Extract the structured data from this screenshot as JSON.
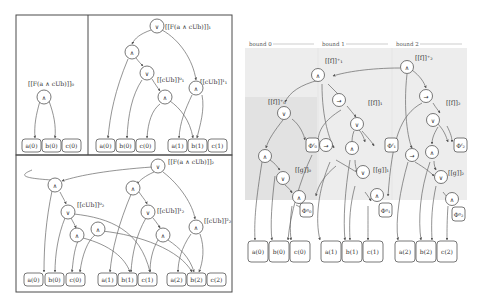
{
  "left_figure": {
    "panels": [
      {
        "id": "bound0",
        "label": "[[F(a ∧ cUb)]]₀",
        "root_symbol": "∧",
        "leaves": [
          "a(0)",
          "b(0)",
          "c(0)"
        ]
      },
      {
        "id": "bound1",
        "label": "[[F(a ∧ cUb)]]₁",
        "root_symbol": "∨",
        "sub_labels": [
          "[[cUb]]⁰₁",
          "[[cUb]]¹₁"
        ],
        "leaves": [
          "a(0)",
          "b(0)",
          "c(0)",
          "a(1)",
          "b(1)",
          "c(1)"
        ]
      },
      {
        "id": "bound2",
        "label": "[[F(a ∧ cUb)]]₂",
        "root_symbol": "∨",
        "sub_labels": [
          "[[cUb]]⁰₂",
          "[[cUb]]¹₂",
          "[[cUb]]²₂"
        ],
        "leaves": [
          "a(0)",
          "b(0)",
          "c(0)",
          "a(1)",
          "b(1)",
          "c(1)",
          "a(2)",
          "b(2)",
          "c(2)"
        ]
      }
    ],
    "symbols": {
      "and": "∧",
      "or": "∨"
    }
  },
  "right_figure": {
    "headers": [
      "bound 0",
      "bound 1",
      "bound 2"
    ],
    "top_labels": [
      "[[f]]⁺₀",
      "[[f]]⁺₁",
      "[[f]]⁺₂"
    ],
    "f_labels": [
      "[[f]]₁",
      "[[f]]₂"
    ],
    "g_labels": [
      "[[g]]₀",
      "[[g]]₁",
      "[[g]]₂"
    ],
    "phi_f": [
      "Φᶠ₀",
      "Φᶠ₁",
      "Φᶠ₂"
    ],
    "phi_g": [
      "Φᵍ₀",
      "Φᵍ₁",
      "Φᵍ₂"
    ],
    "leaves": [
      "a(0)",
      "b(0)",
      "c(0)",
      "a(1)",
      "b(1)",
      "c(1)",
      "a(2)",
      "b(2)",
      "c(2)"
    ],
    "symbols": {
      "and": "∧",
      "or": "∨",
      "implies": "→"
    }
  }
}
